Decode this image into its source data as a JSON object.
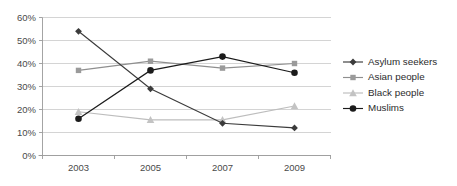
{
  "chart_data": {
    "type": "line",
    "title": "",
    "subtitle": "",
    "xlabel": "",
    "ylabel": "",
    "categories": [
      "2003",
      "2005",
      "2007",
      "2009"
    ],
    "x": [
      2003,
      2005,
      2007,
      2009
    ],
    "ylim": [
      0,
      60
    ],
    "ytick_values": [
      0,
      10,
      20,
      30,
      40,
      50,
      60
    ],
    "ytick_labels": [
      "0%",
      "10%",
      "20%",
      "30%",
      "40%",
      "50%",
      "60%"
    ],
    "xtick_labels": [
      "2003",
      "2005",
      "2007",
      "2009"
    ],
    "grid": "horizontal",
    "legend_position": "right",
    "value_suffix": "%",
    "series": [
      {
        "name": "Asylum seekers",
        "values": [
          54,
          29,
          14,
          12
        ],
        "marker": "diamond",
        "color": "#3b3b3b",
        "line_color": "#3b3b3b"
      },
      {
        "name": "Asian people",
        "values": [
          37,
          41,
          38,
          40
        ],
        "marker": "square",
        "color": "#9a9a9a",
        "line_color": "#8f8f8f"
      },
      {
        "name": "Black people",
        "values": [
          19,
          15.5,
          15.5,
          21.5
        ],
        "marker": "triangle",
        "color": "#c3c3c3",
        "line_color": "#bdbdbd"
      },
      {
        "name": "Muslims",
        "values": [
          16,
          37,
          43,
          36
        ],
        "marker": "circle",
        "color": "#1b1b1b",
        "line_color": "#1b1b1b"
      }
    ]
  },
  "legend": {
    "entries": [
      {
        "label": "Asylum seekers"
      },
      {
        "label": "Asian people"
      },
      {
        "label": "Black people"
      },
      {
        "label": "Muslims"
      }
    ]
  },
  "colors": {
    "background": "#ffffff",
    "gridline": "#c9c9c9",
    "axis": "#9a9a9a",
    "tick_label": "#4a4a4a",
    "legend_label": "#2b2b2b"
  }
}
